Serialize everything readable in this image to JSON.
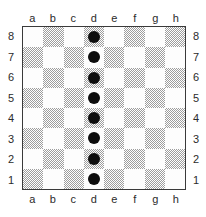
{
  "diagram": {
    "kind": "chess-board-diagram",
    "board_size": 8
  },
  "coordinates": {
    "files": [
      "a",
      "b",
      "c",
      "d",
      "e",
      "f",
      "g",
      "h"
    ],
    "ranks": [
      "8",
      "7",
      "6",
      "5",
      "4",
      "3",
      "2",
      "1"
    ]
  },
  "colors": {
    "light_square": "#fdfdfd",
    "dark_square": "#9d9d9d",
    "piece": "#0d0d0d",
    "border": "#3a3a3a",
    "label_text": "#2b2b2b",
    "background": "#ffffff"
  },
  "squares": [
    [
      "light",
      "dark",
      "light",
      "dark",
      "light",
      "dark",
      "light",
      "dark"
    ],
    [
      "dark",
      "light",
      "dark",
      "light",
      "dark",
      "light",
      "dark",
      "light"
    ],
    [
      "light",
      "dark",
      "light",
      "dark",
      "light",
      "dark",
      "light",
      "dark"
    ],
    [
      "dark",
      "light",
      "dark",
      "light",
      "dark",
      "light",
      "dark",
      "light"
    ],
    [
      "light",
      "dark",
      "light",
      "dark",
      "light",
      "dark",
      "light",
      "dark"
    ],
    [
      "dark",
      "light",
      "dark",
      "light",
      "dark",
      "light",
      "dark",
      "light"
    ],
    [
      "light",
      "dark",
      "light",
      "dark",
      "light",
      "dark",
      "light",
      "dark"
    ],
    [
      "dark",
      "light",
      "dark",
      "light",
      "dark",
      "light",
      "dark",
      "light"
    ]
  ],
  "pieces": [
    {
      "square": "d8",
      "file": "d",
      "rank": "8",
      "color": "black",
      "glyph": "dot"
    },
    {
      "square": "d7",
      "file": "d",
      "rank": "7",
      "color": "black",
      "glyph": "dot"
    },
    {
      "square": "d6",
      "file": "d",
      "rank": "6",
      "color": "black",
      "glyph": "dot"
    },
    {
      "square": "d5",
      "file": "d",
      "rank": "5",
      "color": "black",
      "glyph": "dot"
    },
    {
      "square": "d4",
      "file": "d",
      "rank": "4",
      "color": "black",
      "glyph": "dot"
    },
    {
      "square": "d3",
      "file": "d",
      "rank": "3",
      "color": "black",
      "glyph": "dot"
    },
    {
      "square": "d2",
      "file": "d",
      "rank": "2",
      "color": "black",
      "glyph": "dot"
    },
    {
      "square": "d1",
      "file": "d",
      "rank": "1",
      "color": "black",
      "glyph": "dot"
    }
  ]
}
